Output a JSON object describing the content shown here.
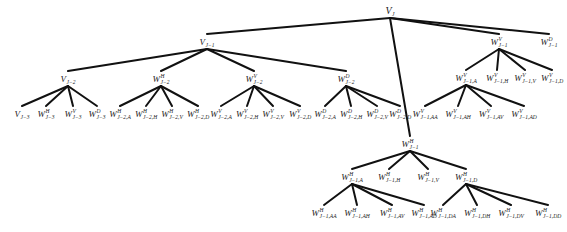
{
  "diagram": {
    "type": "wavelet-packet-decomposition-tree",
    "nodes": [
      {
        "id": "VJ",
        "base": "V",
        "sup": "",
        "sub": "J",
        "x": 390,
        "y": 12,
        "parent": null
      },
      {
        "id": "VJ1",
        "base": "V",
        "sup": "",
        "sub": "J−1",
        "x": 207,
        "y": 43,
        "parent": "VJ"
      },
      {
        "id": "WVJ1",
        "base": "W",
        "sup": "V",
        "sub": "J−1",
        "x": 499,
        "y": 43,
        "parent": "VJ"
      },
      {
        "id": "WDJ1",
        "base": "W",
        "sup": "D",
        "sub": "J−1",
        "x": 549,
        "y": 43,
        "parent": "VJ"
      },
      {
        "id": "WHJ1",
        "base": "W",
        "sup": "H",
        "sub": "J−1",
        "x": 410,
        "y": 145,
        "parent": "VJ"
      },
      {
        "id": "VJ2",
        "base": "V",
        "sup": "",
        "sub": "J−2",
        "x": 68,
        "y": 80,
        "parent": "VJ1"
      },
      {
        "id": "WHJ2",
        "base": "W",
        "sup": "H",
        "sub": "J−2",
        "x": 161,
        "y": 80,
        "parent": "VJ1"
      },
      {
        "id": "WVJ2",
        "base": "W",
        "sup": "V",
        "sub": "J−2",
        "x": 254,
        "y": 80,
        "parent": "VJ1"
      },
      {
        "id": "WDJ2",
        "base": "W",
        "sup": "D",
        "sub": "J−2",
        "x": 346,
        "y": 80,
        "parent": "VJ1"
      },
      {
        "id": "VJ3",
        "base": "V",
        "sup": "",
        "sub": "J−3",
        "x": 22,
        "y": 115,
        "parent": "VJ2"
      },
      {
        "id": "WHJ3",
        "base": "W",
        "sup": "H",
        "sub": "J−3",
        "x": 46,
        "y": 115,
        "parent": "VJ2"
      },
      {
        "id": "WVJ3",
        "base": "W",
        "sup": "V",
        "sub": "J−3",
        "x": 73,
        "y": 115,
        "parent": "VJ2"
      },
      {
        "id": "WDJ3",
        "base": "W",
        "sup": "D",
        "sub": "J−3",
        "x": 97,
        "y": 115,
        "parent": "VJ2"
      },
      {
        "id": "WHJ2A",
        "base": "W",
        "sup": "H",
        "sub": "J−2,A",
        "x": 120,
        "y": 115,
        "parent": "WHJ2"
      },
      {
        "id": "WHJ2H",
        "base": "W",
        "sup": "H",
        "sub": "J−2,H",
        "x": 146,
        "y": 115,
        "parent": "WHJ2"
      },
      {
        "id": "WHJ2V",
        "base": "W",
        "sup": "H",
        "sub": "J−2,V",
        "x": 172,
        "y": 115,
        "parent": "WHJ2"
      },
      {
        "id": "WHJ2D",
        "base": "W",
        "sup": "H",
        "sub": "J−2,D",
        "x": 198,
        "y": 115,
        "parent": "WHJ2"
      },
      {
        "id": "WVJ2A",
        "base": "W",
        "sup": "V",
        "sub": "J−2,A",
        "x": 221,
        "y": 115,
        "parent": "WVJ2"
      },
      {
        "id": "WVJ2H",
        "base": "W",
        "sup": "V",
        "sub": "J−2,H",
        "x": 247,
        "y": 115,
        "parent": "WVJ2"
      },
      {
        "id": "WVJ2V",
        "base": "W",
        "sup": "V",
        "sub": "J−2,V",
        "x": 273,
        "y": 115,
        "parent": "WVJ2"
      },
      {
        "id": "WVJ2D",
        "base": "W",
        "sup": "V",
        "sub": "J−2,D",
        "x": 300,
        "y": 115,
        "parent": "WVJ2"
      },
      {
        "id": "WDJ2A",
        "base": "W",
        "sup": "D",
        "sub": "J−2,A",
        "x": 325,
        "y": 115,
        "parent": "WDJ2"
      },
      {
        "id": "WDJ2H",
        "base": "W",
        "sup": "D",
        "sub": "J−2,H",
        "x": 351,
        "y": 115,
        "parent": "WDJ2"
      },
      {
        "id": "WDJ2V",
        "base": "W",
        "sup": "D",
        "sub": "J−2,V",
        "x": 377,
        "y": 115,
        "parent": "WDJ2"
      },
      {
        "id": "WDJ2D",
        "base": "W",
        "sup": "D",
        "sub": "J−2,D",
        "x": 400,
        "y": 115,
        "parent": "WDJ2"
      },
      {
        "id": "WVJ1A",
        "base": "W",
        "sup": "V",
        "sub": "J−1,A",
        "x": 466,
        "y": 79,
        "parent": "WVJ1"
      },
      {
        "id": "WVJ1H",
        "base": "W",
        "sup": "V",
        "sub": "J−1,H",
        "x": 497,
        "y": 79,
        "parent": "WVJ1"
      },
      {
        "id": "WVJ1V",
        "base": "W",
        "sup": "V",
        "sub": "J−1,V",
        "x": 525,
        "y": 79,
        "parent": "WVJ1"
      },
      {
        "id": "WVJ1D",
        "base": "W",
        "sup": "V",
        "sub": "J−1,D",
        "x": 552,
        "y": 79,
        "parent": "WVJ1"
      },
      {
        "id": "WVJ1AA",
        "base": "W",
        "sup": "V",
        "sub": "J−1,AA",
        "x": 425,
        "y": 115,
        "parent": "WVJ1A"
      },
      {
        "id": "WVJ1AH",
        "base": "W",
        "sup": "V",
        "sub": "J−1,AH",
        "x": 458,
        "y": 115,
        "parent": "WVJ1A"
      },
      {
        "id": "WVJ1AV",
        "base": "W",
        "sup": "V",
        "sub": "J−1,AV",
        "x": 491,
        "y": 115,
        "parent": "WVJ1A"
      },
      {
        "id": "WVJ1AD",
        "base": "W",
        "sup": "V",
        "sub": "J−1,AD",
        "x": 524,
        "y": 115,
        "parent": "WVJ1A"
      },
      {
        "id": "WHJ1A",
        "base": "W",
        "sup": "H",
        "sub": "J−1,A",
        "x": 352,
        "y": 178,
        "parent": "WHJ1"
      },
      {
        "id": "WHJ1H",
        "base": "W",
        "sup": "H",
        "sub": "J−1,H",
        "x": 389,
        "y": 178,
        "parent": "WHJ1"
      },
      {
        "id": "WHJ1V",
        "base": "W",
        "sup": "H",
        "sub": "J−1,V",
        "x": 428,
        "y": 178,
        "parent": "WHJ1"
      },
      {
        "id": "WHJ1D",
        "base": "W",
        "sup": "H",
        "sub": "J−1,D",
        "x": 466,
        "y": 178,
        "parent": "WHJ1"
      },
      {
        "id": "WHJ1AA",
        "base": "W",
        "sup": "H",
        "sub": "J−1,AA",
        "x": 324,
        "y": 214,
        "parent": "WHJ1A"
      },
      {
        "id": "WHJ1AH",
        "base": "W",
        "sup": "H",
        "sub": "J−1,AH",
        "x": 357,
        "y": 214,
        "parent": "WHJ1A"
      },
      {
        "id": "WHJ1AV",
        "base": "W",
        "sup": "H",
        "sub": "J−1,AV",
        "x": 392,
        "y": 214,
        "parent": "WHJ1A"
      },
      {
        "id": "WHJ1AD",
        "base": "W",
        "sup": "H",
        "sub": "J−1,AD",
        "x": 424,
        "y": 214,
        "parent": "WHJ1A"
      },
      {
        "id": "WHJ1DA",
        "base": "W",
        "sup": "H",
        "sub": "J−1,DA",
        "x": 443,
        "y": 214,
        "parent": "WHJ1D"
      },
      {
        "id": "WHJ1DH",
        "base": "W",
        "sup": "H",
        "sub": "J−1,DH",
        "x": 477,
        "y": 214,
        "parent": "WHJ1D"
      },
      {
        "id": "WHJ1DV",
        "base": "W",
        "sup": "H",
        "sub": "J−1,DV",
        "x": 511,
        "y": 214,
        "parent": "WHJ1D"
      },
      {
        "id": "WHJ1DD",
        "base": "W",
        "sup": "H",
        "sub": "J−1,DD",
        "x": 548,
        "y": 214,
        "parent": "WHJ1D"
      }
    ],
    "edge_color": "#111111",
    "edge_width": 2
  }
}
